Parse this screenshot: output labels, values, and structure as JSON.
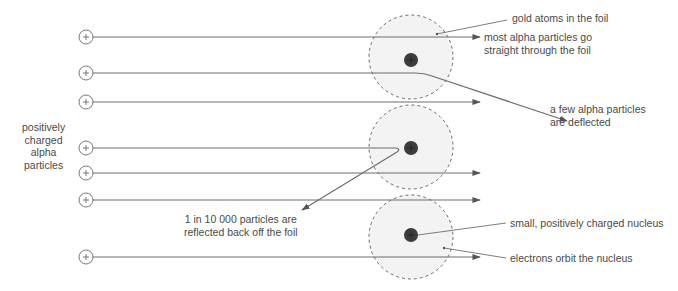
{
  "diagram": {
    "colors": {
      "line": "#6e6e6e",
      "atom_fill": "#f3f3f3",
      "atom_border": "#6a6a6a",
      "nucleus": "#3c3c3c",
      "text": "#4a4a4a"
    },
    "particle_symbol": "+",
    "left_label": {
      "lines": [
        "positively",
        "charged",
        "alpha",
        "particles"
      ]
    },
    "labels": {
      "gold_atoms": "gold atoms in the foil",
      "most_straight_1": "most alpha particles go",
      "most_straight_2": "straight through the foil",
      "few_deflected_1": "a few alpha particles",
      "few_deflected_2": "are deflected",
      "reflected_1": "1 in 10 000 particles are",
      "reflected_2": "reflected back off the foil",
      "nucleus": "small, positively charged nucleus",
      "electrons": "electrons orbit the nucleus"
    },
    "particles": [
      {
        "y": 37,
        "path": "straight"
      },
      {
        "y": 73,
        "path": "deflected"
      },
      {
        "y": 102,
        "path": "straight"
      },
      {
        "y": 148,
        "path": "reflected"
      },
      {
        "y": 173,
        "path": "straight"
      },
      {
        "y": 200,
        "path": "straight"
      },
      {
        "y": 257,
        "path": "straight"
      }
    ],
    "atoms": [
      {
        "cx": 411,
        "cy": 57
      },
      {
        "cx": 411,
        "cy": 147
      },
      {
        "cx": 411,
        "cy": 237
      }
    ]
  }
}
